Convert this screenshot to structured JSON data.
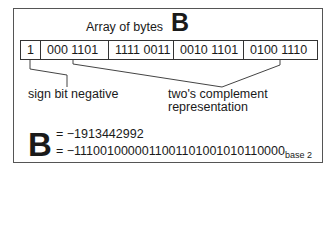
{
  "diagram": {
    "title": "Array of bytes",
    "array_name": "B",
    "bytes": [
      {
        "value": "1",
        "width": 20
      },
      {
        "value": "000 1101",
        "width": 68
      },
      {
        "value": "1111 0011",
        "width": 65
      },
      {
        "value": "0010 1101",
        "width": 70
      },
      {
        "value": "0100 1110",
        "width": 73
      }
    ],
    "annotations": {
      "sign_bit": "sign bit negative",
      "twos_complement_line1": "two's complement",
      "twos_complement_line2": "representation"
    },
    "result": {
      "variable": "B",
      "decimal": "= −1913442992",
      "binary": "= −1110010000011001101001010110000",
      "base_label": "base 2"
    }
  }
}
